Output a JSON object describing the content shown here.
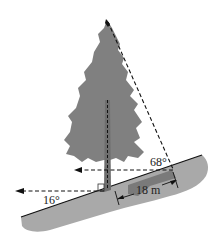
{
  "figure": {
    "type": "tree-on-slope trigonometry diagram",
    "labels": {
      "angle_top": "68°",
      "angle_slope": "16°",
      "distance": "18 m"
    },
    "colors": {
      "tree": "#808080",
      "ground": "#a9a9a9",
      "ground_shadow": "#7a7a7a",
      "lines": "#111111",
      "background": "#ffffff"
    }
  }
}
